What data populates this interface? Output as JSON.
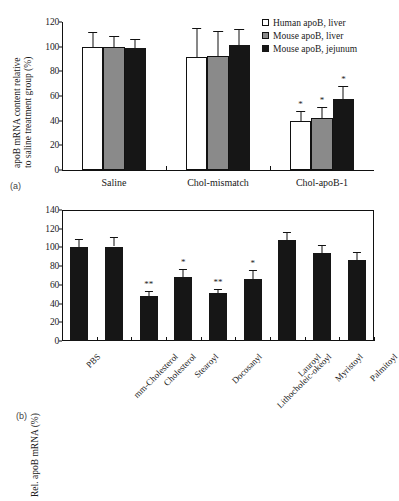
{
  "figure": {
    "panel_a_label": "(a)",
    "panel_b_label": "(b)"
  },
  "chart_data": [
    {
      "panel": "(a)",
      "type": "bar",
      "title": "",
      "xlabel": "",
      "ylabel": "apoB mRNA content relative to saline treatment group (%)",
      "ylabel_line1": "apoB mRNA content relative",
      "ylabel_line2": "to saline treatment group (%)",
      "ylim": [
        0,
        120
      ],
      "yticks": [
        0,
        20,
        40,
        60,
        80,
        100,
        120
      ],
      "grid": false,
      "legend_position": "top-right",
      "categories": [
        "Saline",
        "Chol-mismatch",
        "Chol-apoB-1"
      ],
      "series": [
        {
          "name": "Human apoB, liver",
          "color": "#ffffff",
          "values": [
            99.5,
            92.0,
            39.5
          ],
          "errors": [
            12.5,
            23.5,
            8.5
          ],
          "significance": [
            "",
            "",
            "*"
          ]
        },
        {
          "name": "Mouse apoB, liver",
          "color": "#8a8a8a",
          "values": [
            99.5,
            92.5,
            41.8
          ],
          "errors": [
            9.5,
            20.0,
            9.0
          ],
          "significance": [
            "",
            "",
            "*"
          ]
        },
        {
          "name": "Mouse apoB, jejunum",
          "color": "#161616",
          "values": [
            99.0,
            101.5,
            57.5
          ],
          "errors": [
            7.5,
            12.5,
            11.0
          ],
          "significance": [
            "",
            "",
            "*"
          ]
        }
      ]
    },
    {
      "panel": "(b)",
      "type": "bar",
      "title": "",
      "xlabel": "",
      "ylabel": "Rel. apoB mRNA (%)",
      "ylim": [
        0,
        140
      ],
      "yticks": [
        0,
        20,
        40,
        60,
        80,
        100,
        120,
        140
      ],
      "grid": false,
      "legend_position": "none",
      "categories": [
        "PBS",
        "mm-Cholesterol",
        "Cholesterol",
        "Stearoyl",
        "Docosanyl",
        "Lithocholeic-okeoyl",
        "Lauroyl",
        "Myristoyl",
        "Palmitoyl"
      ],
      "series": [
        {
          "name": "Rel. apoB mRNA",
          "color": "#161616",
          "values": [
            100,
            101,
            48.5,
            68,
            51,
            66,
            108,
            94.5,
            86.5
          ],
          "errors": [
            9.5,
            10.5,
            4.5,
            8.5,
            4.5,
            9.5,
            8.0,
            8.5,
            9.0
          ],
          "significance": [
            "",
            "",
            "**",
            "*",
            "**",
            "*",
            "",
            "",
            ""
          ]
        }
      ]
    }
  ]
}
